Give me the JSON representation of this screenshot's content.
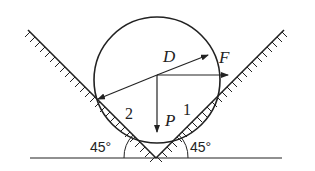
{
  "diagram": {
    "type": "physics-free-body",
    "colors": {
      "stroke": "#222222",
      "background": "#ffffff"
    },
    "labels": {
      "diameter": "D",
      "force_horizontal": "F",
      "weight": "P",
      "contact_right": "1",
      "contact_left": "2",
      "angle_left": "45°",
      "angle_right": "45°"
    },
    "icons": {
      "cylinder": "circle-shape",
      "left_wall": "hatched-incline-left",
      "right_wall": "hatched-incline-right",
      "ground": "ground-line"
    }
  }
}
